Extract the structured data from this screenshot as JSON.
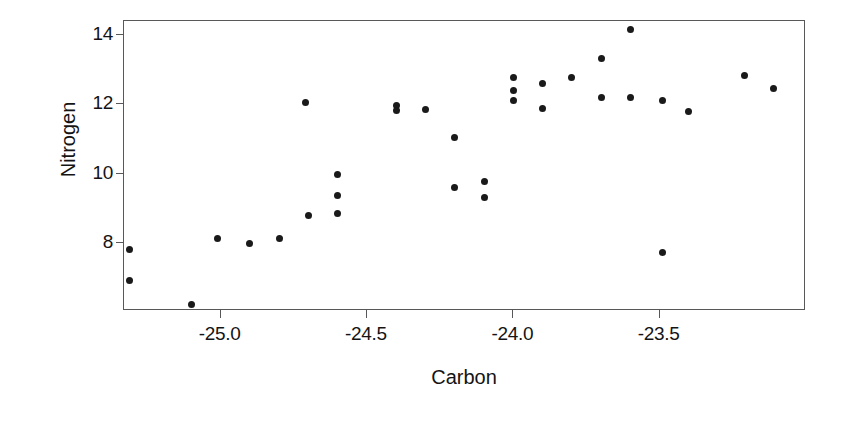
{
  "chart_data": {
    "type": "scatter",
    "title": "",
    "xlabel": "Carbon",
    "ylabel": "Nitrogen",
    "xlim": [
      -25.33,
      -23.0
    ],
    "ylim": [
      6.05,
      14.4
    ],
    "xticks": [
      -25.0,
      -24.5,
      -24.0,
      -23.5
    ],
    "xticklabels": [
      "-25.0",
      "-24.5",
      "-24.0",
      "-23.5"
    ],
    "yticks": [
      8,
      10,
      12,
      14
    ],
    "yticklabels": [
      "8",
      "10",
      "12",
      "14"
    ],
    "grid": false,
    "legend": null,
    "marker": "filled-circle",
    "marker_color": "#1a1a1a",
    "frame_color": "#58585a",
    "background": "#ffffff",
    "n_points": 33,
    "points": [
      {
        "x": -25.31,
        "y": 7.81
      },
      {
        "x": -25.31,
        "y": 6.92
      },
      {
        "x": -25.1,
        "y": 6.25
      },
      {
        "x": -25.01,
        "y": 8.14
      },
      {
        "x": -24.9,
        "y": 8.0
      },
      {
        "x": -24.8,
        "y": 8.14
      },
      {
        "x": -24.71,
        "y": 12.04
      },
      {
        "x": -24.7,
        "y": 8.79
      },
      {
        "x": -24.6,
        "y": 9.99
      },
      {
        "x": -24.6,
        "y": 9.39
      },
      {
        "x": -24.6,
        "y": 8.87
      },
      {
        "x": -24.4,
        "y": 11.96
      },
      {
        "x": -24.4,
        "y": 11.82
      },
      {
        "x": -24.3,
        "y": 11.85
      },
      {
        "x": -24.2,
        "y": 11.06
      },
      {
        "x": -24.2,
        "y": 9.61
      },
      {
        "x": -24.1,
        "y": 9.78
      },
      {
        "x": -24.1,
        "y": 9.31
      },
      {
        "x": -24.0,
        "y": 12.78
      },
      {
        "x": -24.0,
        "y": 12.4
      },
      {
        "x": -24.0,
        "y": 12.1
      },
      {
        "x": -23.9,
        "y": 12.59
      },
      {
        "x": -23.9,
        "y": 11.88
      },
      {
        "x": -23.8,
        "y": 12.78
      },
      {
        "x": -23.7,
        "y": 13.33
      },
      {
        "x": -23.7,
        "y": 12.21
      },
      {
        "x": -23.6,
        "y": 14.15
      },
      {
        "x": -23.6,
        "y": 12.21
      },
      {
        "x": -23.49,
        "y": 12.1
      },
      {
        "x": -23.49,
        "y": 7.73
      },
      {
        "x": -23.4,
        "y": 11.8
      },
      {
        "x": -23.21,
        "y": 12.84
      },
      {
        "x": -23.11,
        "y": 12.45
      }
    ]
  }
}
